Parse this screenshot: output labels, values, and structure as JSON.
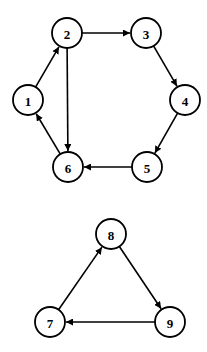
{
  "diagram": {
    "type": "directed-graph",
    "node_radius": 15,
    "colors": {
      "stroke": "#000000",
      "fill": "#ffffff",
      "background": "#ffffff"
    },
    "nodes": [
      {
        "id": "1",
        "label": "1",
        "x": 28,
        "y": 100
      },
      {
        "id": "2",
        "label": "2",
        "x": 67,
        "y": 33
      },
      {
        "id": "3",
        "label": "3",
        "x": 146,
        "y": 33
      },
      {
        "id": "4",
        "label": "4",
        "x": 185,
        "y": 100
      },
      {
        "id": "5",
        "label": "5",
        "x": 147,
        "y": 167
      },
      {
        "id": "6",
        "label": "6",
        "x": 68,
        "y": 167
      },
      {
        "id": "7",
        "label": "7",
        "x": 50,
        "y": 322
      },
      {
        "id": "8",
        "label": "8",
        "x": 111,
        "y": 234
      },
      {
        "id": "9",
        "label": "9",
        "x": 170,
        "y": 322
      }
    ],
    "edges": [
      {
        "from": "1",
        "to": "2"
      },
      {
        "from": "2",
        "to": "3"
      },
      {
        "from": "2",
        "to": "6"
      },
      {
        "from": "3",
        "to": "4"
      },
      {
        "from": "4",
        "to": "5"
      },
      {
        "from": "5",
        "to": "6"
      },
      {
        "from": "6",
        "to": "1"
      },
      {
        "from": "7",
        "to": "8"
      },
      {
        "from": "8",
        "to": "9"
      },
      {
        "from": "9",
        "to": "7"
      }
    ],
    "components": [
      {
        "name": "component-a",
        "nodes": [
          "1",
          "2",
          "3",
          "4",
          "5",
          "6"
        ]
      },
      {
        "name": "component-b",
        "nodes": [
          "7",
          "8",
          "9"
        ]
      }
    ]
  }
}
